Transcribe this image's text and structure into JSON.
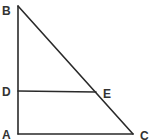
{
  "figure": {
    "type": "triangle-with-parallel-segment",
    "points": {
      "A": {
        "label": "A"
      },
      "B": {
        "label": "B"
      },
      "C": {
        "label": "C"
      },
      "D": {
        "label": "D"
      },
      "E": {
        "label": "E"
      }
    },
    "segments": [
      "AB",
      "BC",
      "AC",
      "DE"
    ],
    "line_color": "#2a2a2a",
    "label_color": "#333333"
  }
}
